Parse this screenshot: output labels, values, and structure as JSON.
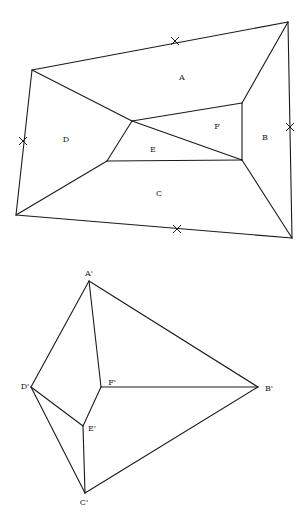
{
  "diagram": {
    "top_figure": {
      "description": "Planar subdivision into faces A-F with X marks on outer edges",
      "vertices": {
        "tl": [
          32,
          70
        ],
        "tr": [
          288,
          22
        ],
        "br": [
          292,
          238
        ],
        "bl": [
          16,
          215
        ],
        "i_left": [
          132,
          121
        ],
        "i_top_right": [
          242,
          103
        ],
        "i_bot_right": [
          242,
          160
        ],
        "i_bot_left": [
          107,
          161
        ]
      },
      "edges": [
        [
          "tl",
          "tr"
        ],
        [
          "tr",
          "br"
        ],
        [
          "br",
          "bl"
        ],
        [
          "bl",
          "tl"
        ],
        [
          "tl",
          "i_left"
        ],
        [
          "tr",
          "i_top_right"
        ],
        [
          "br",
          "i_bot_right"
        ],
        [
          "bl",
          "i_bot_left"
        ],
        [
          "i_left",
          "i_top_right"
        ],
        [
          "i_top_right",
          "i_bot_right"
        ],
        [
          "i_left",
          "i_bot_right"
        ],
        [
          "i_left",
          "i_bot_left"
        ],
        [
          "i_bot_left",
          "i_bot_right"
        ]
      ],
      "x_marks": [
        [
          175,
          41
        ],
        [
          290,
          127
        ],
        [
          177,
          229
        ],
        [
          23,
          141
        ]
      ],
      "face_labels": [
        {
          "text": "A",
          "x": 182,
          "y": 78
        },
        {
          "text": "B",
          "x": 265,
          "y": 138
        },
        {
          "text": "C",
          "x": 159,
          "y": 194
        },
        {
          "text": "D",
          "x": 66,
          "y": 140
        },
        {
          "text": "E",
          "x": 153,
          "y": 150
        },
        {
          "text": "F",
          "x": 217,
          "y": 127
        }
      ]
    },
    "bottom_figure": {
      "description": "Dual graph with nodes A'-F'",
      "nodes": {
        "A'": [
          89,
          281
        ],
        "B'": [
          258,
          387
        ],
        "C'": [
          85,
          493
        ],
        "D'": [
          31,
          387
        ],
        "E'": [
          83,
          426
        ],
        "F'": [
          101,
          387
        ]
      },
      "edges": [
        [
          "A'",
          "D'"
        ],
        [
          "A'",
          "F'"
        ],
        [
          "A'",
          "B'"
        ],
        [
          "F'",
          "B'"
        ],
        [
          "F'",
          "E'"
        ],
        [
          "D'",
          "E'"
        ],
        [
          "D'",
          "C'"
        ],
        [
          "E'",
          "C'"
        ],
        [
          "C'",
          "B'"
        ]
      ],
      "node_labels": [
        {
          "text": "A'",
          "x": 89,
          "y": 274
        },
        {
          "text": "B'",
          "x": 269,
          "y": 389
        },
        {
          "text": "C'",
          "x": 84,
          "y": 503
        },
        {
          "text": "D'",
          "x": 25,
          "y": 387
        },
        {
          "text": "E'",
          "x": 92,
          "y": 429
        },
        {
          "text": "F'",
          "x": 112,
          "y": 383
        }
      ]
    }
  }
}
